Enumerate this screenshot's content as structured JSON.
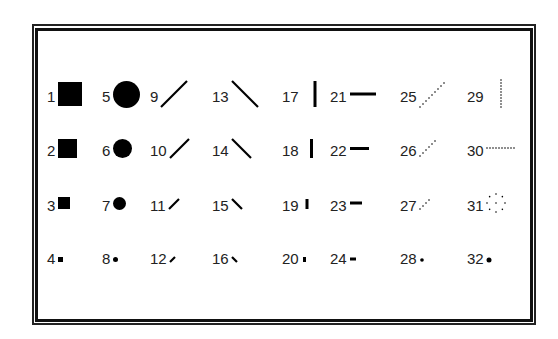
{
  "items": [
    {
      "n": "1",
      "kind": "square",
      "size": 24
    },
    {
      "n": "2",
      "kind": "square",
      "size": 19
    },
    {
      "n": "3",
      "kind": "square",
      "size": 12
    },
    {
      "n": "4",
      "kind": "square",
      "size": 5
    },
    {
      "n": "5",
      "kind": "circle",
      "size": 27
    },
    {
      "n": "6",
      "kind": "circle",
      "size": 19
    },
    {
      "n": "7",
      "kind": "circle",
      "size": 13
    },
    {
      "n": "8",
      "kind": "circle",
      "size": 5
    },
    {
      "n": "9",
      "kind": "slash",
      "size": 26
    },
    {
      "n": "10",
      "kind": "slash",
      "size": 19
    },
    {
      "n": "11",
      "kind": "slash",
      "size": 10
    },
    {
      "n": "12",
      "kind": "slash",
      "size": 5
    },
    {
      "n": "13",
      "kind": "backslash",
      "size": 26
    },
    {
      "n": "14",
      "kind": "backslash",
      "size": 19
    },
    {
      "n": "15",
      "kind": "backslash",
      "size": 10
    },
    {
      "n": "16",
      "kind": "backslash",
      "size": 5
    },
    {
      "n": "17",
      "kind": "vbar",
      "size": 26
    },
    {
      "n": "18",
      "kind": "vbar",
      "size": 19
    },
    {
      "n": "19",
      "kind": "vbar",
      "size": 10
    },
    {
      "n": "20",
      "kind": "vbar",
      "size": 5
    },
    {
      "n": "21",
      "kind": "hbar",
      "size": 26
    },
    {
      "n": "22",
      "kind": "hbar",
      "size": 19
    },
    {
      "n": "23",
      "kind": "hbar",
      "size": 12
    },
    {
      "n": "24",
      "kind": "hbar",
      "size": 6
    },
    {
      "n": "25",
      "kind": "dotslash",
      "size": 26
    },
    {
      "n": "26",
      "kind": "dotslash",
      "size": 16
    },
    {
      "n": "27",
      "kind": "dotslash",
      "size": 9
    },
    {
      "n": "28",
      "kind": "dot",
      "size": 2
    },
    {
      "n": "29",
      "kind": "dotvbar",
      "size": 28
    },
    {
      "n": "30",
      "kind": "dothbar",
      "size": 28
    },
    {
      "n": "31",
      "kind": "dotcircle",
      "size": 18
    },
    {
      "n": "32",
      "kind": "dot",
      "size": 3
    }
  ]
}
